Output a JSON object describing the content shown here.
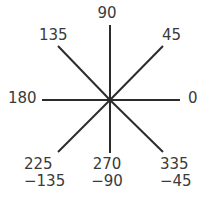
{
  "figure": {
    "name": "angle-ray-diagram",
    "background_color": "#ffffff",
    "line_color": "#2b2b2b",
    "text_color": "#3a3a3a",
    "center": {
      "x": 110,
      "y": 100
    }
  },
  "labels": {
    "deg_90": "90",
    "deg_135": "135",
    "deg_45": "45",
    "deg_180": "180",
    "deg_0": "0",
    "deg_225": "225",
    "deg_225_neg": "−135",
    "deg_270": "270",
    "deg_270_neg": "−90",
    "deg_335": "335",
    "deg_335_neg": "−45"
  },
  "chart_data": {
    "type": "scatter",
    "title": "",
    "xlabel": "",
    "ylabel": "",
    "grid": false,
    "legend": null,
    "center": {
      "x": 110,
      "y": 100
    },
    "rays": [
      {
        "angle_deg": 0,
        "label": "0",
        "alt_label": null,
        "x2": 180,
        "y2": 100
      },
      {
        "angle_deg": 45,
        "label": "45",
        "alt_label": null,
        "x2": 163,
        "y2": 46
      },
      {
        "angle_deg": 90,
        "label": "90",
        "alt_label": null,
        "x2": 110,
        "y2": 25
      },
      {
        "angle_deg": 135,
        "label": "135",
        "alt_label": null,
        "x2": 58,
        "y2": 46
      },
      {
        "angle_deg": 180,
        "label": "180",
        "alt_label": null,
        "x2": 42,
        "y2": 100
      },
      {
        "angle_deg": 225,
        "label": "225",
        "alt_label": "−135",
        "x2": 58,
        "y2": 152
      },
      {
        "angle_deg": 270,
        "label": "270",
        "alt_label": "−90",
        "x2": 110,
        "y2": 153
      },
      {
        "angle_deg": 335,
        "label": "335",
        "alt_label": "−45",
        "x2": 163,
        "y2": 152
      }
    ]
  }
}
